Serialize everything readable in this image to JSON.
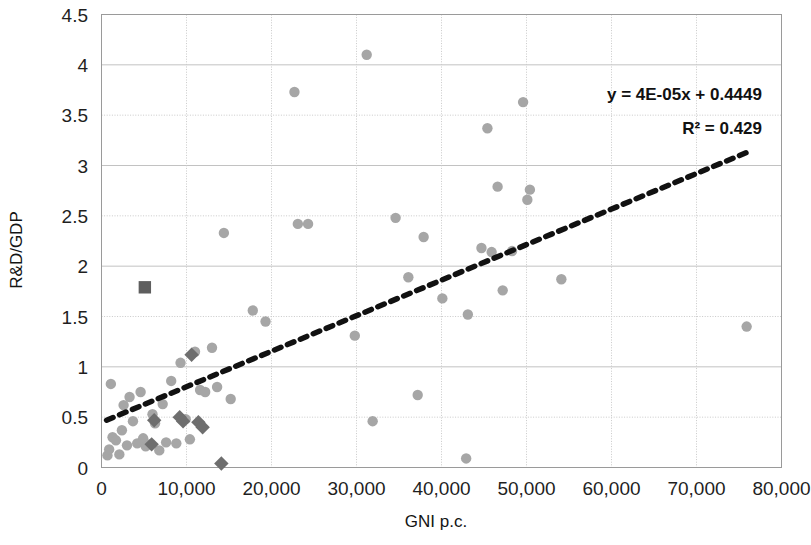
{
  "chart_data": {
    "type": "scatter",
    "title": "",
    "xlabel": "GNI p.c.",
    "ylabel": "R&D/GDP",
    "xlim": [
      0,
      80000
    ],
    "ylim": [
      0,
      4.5
    ],
    "x_ticks": [
      "0",
      "10,000",
      "20,000",
      "30,000",
      "40,000",
      "50,000",
      "60,000",
      "70,000",
      "80,000"
    ],
    "x_tick_values": [
      0,
      10000,
      20000,
      30000,
      40000,
      50000,
      60000,
      70000,
      80000
    ],
    "y_ticks": [
      "0",
      "0.5",
      "1",
      "1.5",
      "2",
      "2.5",
      "3",
      "3.5",
      "4",
      "4.5"
    ],
    "y_tick_values": [
      0,
      0.5,
      1,
      1.5,
      2,
      2.5,
      3,
      3.5,
      4,
      4.5
    ],
    "grid": true,
    "legend": "none",
    "annotations": [
      {
        "name": "trendline-equation",
        "text": "y = 4E-05x + 0.4449"
      },
      {
        "name": "r-squared",
        "text": "R² = 0.429"
      }
    ],
    "trendline": {
      "type": "linear-dashed",
      "slope": 4e-05,
      "intercept": 0.4449,
      "x_start": 600,
      "x_end": 76500,
      "y_start": 0.47,
      "y_end": 3.15
    },
    "series": [
      {
        "name": "countries",
        "marker": "circle",
        "color": "#a6a6a6",
        "points": [
          [
            700,
            0.12
          ],
          [
            900,
            0.18
          ],
          [
            1100,
            0.83
          ],
          [
            1300,
            0.3
          ],
          [
            1700,
            0.27
          ],
          [
            2100,
            0.13
          ],
          [
            2400,
            0.37
          ],
          [
            2600,
            0.62
          ],
          [
            3000,
            0.22
          ],
          [
            3300,
            0.7
          ],
          [
            3700,
            0.46
          ],
          [
            4200,
            0.24
          ],
          [
            4600,
            0.75
          ],
          [
            4900,
            0.29
          ],
          [
            5200,
            0.21
          ],
          [
            5600,
            0.23
          ],
          [
            6000,
            0.53
          ],
          [
            6300,
            0.44
          ],
          [
            6800,
            0.17
          ],
          [
            7200,
            0.63
          ],
          [
            7600,
            0.25
          ],
          [
            8200,
            0.86
          ],
          [
            8800,
            0.24
          ],
          [
            9300,
            1.04
          ],
          [
            9900,
            0.48
          ],
          [
            10400,
            0.28
          ],
          [
            11000,
            1.15
          ],
          [
            11600,
            0.77
          ],
          [
            12200,
            0.75
          ],
          [
            13000,
            1.19
          ],
          [
            13600,
            0.8
          ],
          [
            14400,
            2.33
          ],
          [
            15200,
            0.68
          ],
          [
            17800,
            1.56
          ],
          [
            19300,
            1.45
          ],
          [
            22700,
            3.73
          ],
          [
            23100,
            2.42
          ],
          [
            24300,
            2.42
          ],
          [
            29800,
            1.31
          ],
          [
            31200,
            4.1
          ],
          [
            31900,
            0.46
          ],
          [
            34600,
            2.48
          ],
          [
            36100,
            1.89
          ],
          [
            37200,
            0.72
          ],
          [
            37900,
            2.29
          ],
          [
            40100,
            1.68
          ],
          [
            42900,
            0.09
          ],
          [
            43100,
            1.52
          ],
          [
            44700,
            2.18
          ],
          [
            45400,
            3.37
          ],
          [
            45900,
            2.14
          ],
          [
            46600,
            2.79
          ],
          [
            47200,
            1.76
          ],
          [
            48300,
            2.15
          ],
          [
            49600,
            3.63
          ],
          [
            50100,
            2.66
          ],
          [
            50400,
            2.76
          ],
          [
            54100,
            1.87
          ],
          [
            75900,
            1.4
          ]
        ]
      },
      {
        "name": "highlighted-countries",
        "marker": "diamond",
        "color": "#6e6e6e",
        "points": [
          [
            5900,
            0.23
          ],
          [
            6200,
            0.47
          ],
          [
            9200,
            0.5
          ],
          [
            9600,
            0.46
          ],
          [
            10600,
            1.12
          ],
          [
            11400,
            0.45
          ],
          [
            11900,
            0.4
          ],
          [
            14100,
            0.04
          ]
        ]
      },
      {
        "name": "reference-country",
        "marker": "square",
        "color": "#5e5e5e",
        "points": [
          [
            5100,
            1.79
          ]
        ]
      }
    ]
  },
  "axes": {
    "y_title": "R&D/GDP",
    "x_title": "GNI p.c."
  }
}
